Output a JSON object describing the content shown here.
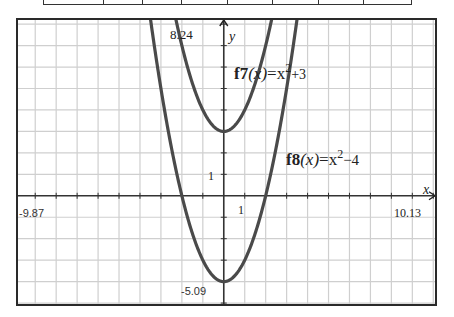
{
  "table": {
    "column_widths": [
      60,
      40,
      39,
      46,
      45,
      46,
      46,
      47
    ]
  },
  "window": {
    "xmin": -9.87,
    "xmax": 10.13,
    "ymin": -5.09,
    "ymax": 8.24,
    "xmin_label": "-9.87",
    "xmax_label": "10.13",
    "ymin_label": "-5.09",
    "ymax_label": "8.24",
    "x_axis_label": "x",
    "y_axis_label": "y",
    "x_tick_label": "1",
    "y_tick_label": "1"
  },
  "functions": [
    {
      "name": "f7",
      "expr": "x^2+3",
      "label_prefix": "f7",
      "label_var": "(x)",
      "label_eq": "=x",
      "label_exp": "2",
      "label_tail": "+3",
      "a": 1,
      "c": 3,
      "color": "#4a4a4a"
    },
    {
      "name": "f8",
      "expr": "x^2-4",
      "label_prefix": "f8",
      "label_var": "(x)",
      "label_eq": "=x",
      "label_exp": "2",
      "label_tail": "−4",
      "a": 1,
      "c": -4,
      "color": "#4a4a4a"
    }
  ],
  "colors": {
    "frame": "#2a2a2a",
    "grid": "#cfcfcf",
    "axis": "#333333",
    "curve": "#4a4a4a",
    "label": "#333333"
  },
  "chart_data": {
    "type": "line",
    "title": "",
    "xlabel": "x",
    "ylabel": "y",
    "xlim": [
      -9.87,
      10.13
    ],
    "ylim": [
      -5.09,
      8.24
    ],
    "grid": true,
    "grid_spacing": 1,
    "tick_labels": {
      "x": [
        "1"
      ],
      "y": [
        "1"
      ]
    },
    "window_labels": [
      "-9.87",
      "10.13",
      "8.24",
      "-5.09"
    ],
    "series": [
      {
        "name": "f7(x)=x^2+3",
        "x": [
          -2.3,
          -2,
          -1.5,
          -1,
          -0.5,
          0,
          0.5,
          1,
          1.5,
          2,
          2.3
        ],
        "values": [
          8.29,
          7,
          5.25,
          4,
          3.25,
          3,
          3.25,
          4,
          5.25,
          7,
          8.29
        ]
      },
      {
        "name": "f8(x)=x^2-4",
        "x": [
          -3.5,
          -3,
          -2.5,
          -2,
          -1.5,
          -1,
          -0.5,
          0,
          0.5,
          1,
          1.5,
          2,
          2.5,
          3,
          3.5
        ],
        "values": [
          8.25,
          5,
          2.25,
          0,
          -1.75,
          -3,
          -3.75,
          -4,
          -3.75,
          -3,
          -1.75,
          0,
          2.25,
          5,
          8.25
        ]
      }
    ],
    "annotations": [
      {
        "text": "f7(x)=x^2+3",
        "x": 0.1,
        "y": 5.6
      },
      {
        "text": "f8(x)=x^2-4",
        "x": 2.5,
        "y": 1.4
      }
    ]
  }
}
